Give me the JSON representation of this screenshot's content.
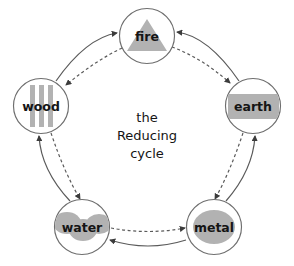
{
  "diagram": {
    "title_lines": [
      "the",
      "Reducing",
      "cycle"
    ],
    "type": "cycle-diagram",
    "colors": {
      "glyph_gray": "#b2b2b2",
      "node_stroke": "#6e6e6e",
      "edge_stroke": "#5a5a5a",
      "text": "#151515",
      "background": "#ffffff"
    },
    "nodes": [
      {
        "id": "fire",
        "label": "fire",
        "glyph": "triangle-icon",
        "cx": 147,
        "cy": 36,
        "r": 28
      },
      {
        "id": "earth",
        "label": "earth",
        "glyph": "rectangle-icon",
        "cx": 253,
        "cy": 106,
        "r": 28
      },
      {
        "id": "metal",
        "label": "metal",
        "glyph": "ellipse-icon",
        "cx": 214,
        "cy": 227,
        "r": 28
      },
      {
        "id": "water",
        "label": "water",
        "glyph": "wave-blob-icon",
        "cx": 82,
        "cy": 227,
        "r": 28
      },
      {
        "id": "wood",
        "label": "wood",
        "glyph": "vertical-bars-icon",
        "cx": 41,
        "cy": 106,
        "r": 28
      }
    ],
    "edges": [
      {
        "id": "wood-to-fire",
        "from": "wood",
        "to": "fire",
        "style": "solid"
      },
      {
        "id": "fire-to-wood",
        "from": "fire",
        "to": "wood",
        "style": "dashed"
      },
      {
        "id": "earth-to-fire",
        "from": "earth",
        "to": "fire",
        "style": "solid"
      },
      {
        "id": "fire-to-earth",
        "from": "fire",
        "to": "earth",
        "style": "dashed"
      },
      {
        "id": "metal-to-earth",
        "from": "metal",
        "to": "earth",
        "style": "solid"
      },
      {
        "id": "earth-to-metal",
        "from": "earth",
        "to": "metal",
        "style": "dashed"
      },
      {
        "id": "metal-to-water",
        "from": "metal",
        "to": "water",
        "style": "solid"
      },
      {
        "id": "water-to-metal",
        "from": "water",
        "to": "metal",
        "style": "dashed"
      },
      {
        "id": "water-to-wood",
        "from": "water",
        "to": "wood",
        "style": "solid"
      },
      {
        "id": "wood-to-water",
        "from": "wood",
        "to": "water",
        "style": "dashed"
      }
    ]
  }
}
